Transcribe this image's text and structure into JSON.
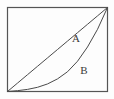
{
  "figure": {
    "title": "",
    "background_color": "#fdfdfd",
    "frame": {
      "name": "plot-frame",
      "stroke": "#555555",
      "stroke_width": 1.2,
      "x": 7,
      "y": 7,
      "width": 101,
      "height": 85
    }
  },
  "labels": [
    {
      "id": "A",
      "text": "A",
      "x": 76,
      "y": 42
    },
    {
      "id": "B",
      "text": "B",
      "x": 84,
      "y": 74
    }
  ],
  "chart_data": {
    "type": "line",
    "title": "",
    "xlabel": "",
    "ylabel": "",
    "xlim": [
      0,
      1
    ],
    "ylim": [
      0,
      1
    ],
    "grid": false,
    "legend": "inline-annotations",
    "axis_ticks": false,
    "line_color": "#4a4a4a",
    "line_width": 1.0,
    "series": [
      {
        "name": "A",
        "label": "A",
        "shape": "straight-diagonal",
        "description": "Straight line from bottom-left corner to top-right corner",
        "x": [
          0.0,
          0.1,
          0.2,
          0.3,
          0.4,
          0.5,
          0.6,
          0.7,
          0.8,
          0.9,
          1.0
        ],
        "values": [
          0.0,
          0.1,
          0.2,
          0.3,
          0.4,
          0.5,
          0.6,
          0.7,
          0.8,
          0.9,
          1.0
        ]
      },
      {
        "name": "B",
        "label": "B",
        "shape": "convex-increasing",
        "description": "Convex curve from bottom-left corner rising steeply to top-right corner, lying below the diagonal",
        "x": [
          0.0,
          0.1,
          0.2,
          0.3,
          0.4,
          0.5,
          0.6,
          0.7,
          0.8,
          0.9,
          1.0
        ],
        "values": [
          0.0,
          0.01,
          0.025,
          0.05,
          0.09,
          0.15,
          0.235,
          0.36,
          0.53,
          0.74,
          1.0
        ]
      }
    ]
  }
}
